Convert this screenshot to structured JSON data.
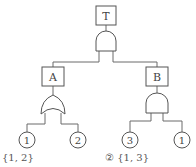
{
  "diagram": {
    "type": "fault-tree",
    "top_event": {
      "label": "T",
      "gate": "AND"
    },
    "intermediate_events": [
      {
        "label": "A",
        "gate": "OR",
        "inputs": [
          "1",
          "2"
        ]
      },
      {
        "label": "B",
        "gate": "AND",
        "inputs": [
          "3",
          "1"
        ]
      }
    ],
    "basic_events": [
      "1",
      "2",
      "3",
      "1"
    ],
    "line_color": "#6a6a6a"
  },
  "options": {
    "left_text": "{1, 2}",
    "right_marker": "②",
    "right_text": "{1, 3}"
  }
}
